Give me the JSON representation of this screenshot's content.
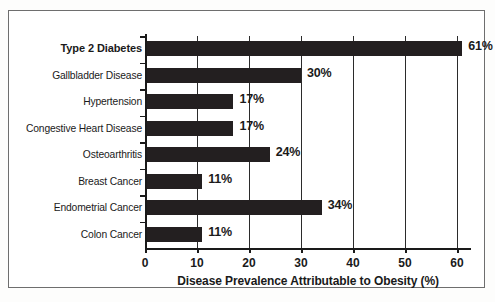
{
  "chart_data": {
    "type": "bar",
    "orientation": "horizontal",
    "title": "",
    "xlabel": "Disease Prevalence Attributable to Obesity (%)",
    "ylabel": "",
    "xlim": [
      0,
      62
    ],
    "xticks": [
      0,
      10,
      20,
      30,
      40,
      50,
      60
    ],
    "xtick_labels": [
      "0",
      "10",
      "20",
      "30",
      "40",
      "50",
      "60"
    ],
    "grid": "vertical",
    "legend": "none",
    "bar_color": "#231f20",
    "categories": [
      "Type 2 Diabetes",
      "Gallbladder Disease",
      "Hypertension",
      "Congestive Heart Disease",
      "Osteoarthritis",
      "Breast Cancer",
      "Endometrial Cancer",
      "Colon Cancer"
    ],
    "values": [
      61,
      30,
      17,
      17,
      24,
      11,
      34,
      11
    ],
    "value_labels": [
      "61%",
      "30%",
      "17%",
      "17%",
      "24%",
      "11%",
      "34%",
      "11%"
    ],
    "emphasized_category": "Type 2 Diabetes"
  },
  "axis": {
    "x_title": "Disease Prevalence Attributable to Obesity (%)"
  }
}
